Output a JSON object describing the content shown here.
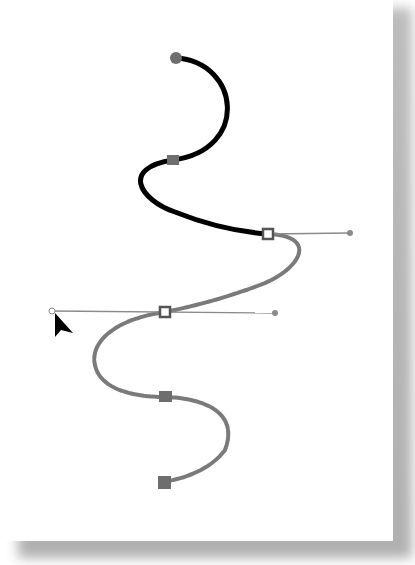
{
  "figure": {
    "colors": {
      "page": "#ffffff",
      "shadow": "#a8a8a8",
      "selected_segment": "#000000",
      "unselected_segment": "#7a7a7a",
      "handle_line": "#8a8a8a",
      "anchor_fill": "#6e6e6e",
      "selected_anchor_fill": "#ffffff",
      "cursor": "#000000"
    },
    "anchors": [
      {
        "id": "start",
        "x": 176,
        "y": 58,
        "shape": "round",
        "selected": false
      },
      {
        "id": "a2",
        "x": 173,
        "y": 160,
        "shape": "square",
        "selected": false
      },
      {
        "id": "a3",
        "x": 268,
        "y": 234,
        "shape": "square",
        "selected": true
      },
      {
        "id": "a4",
        "x": 165,
        "y": 312,
        "shape": "square",
        "selected": true
      },
      {
        "id": "a5",
        "x": 165,
        "y": 397,
        "shape": "square",
        "selected": false
      },
      {
        "id": "end",
        "x": 164,
        "y": 482,
        "shape": "square",
        "selected": false
      }
    ],
    "handles": [
      {
        "from": [
          268,
          234
        ],
        "to": [
          350,
          233
        ]
      },
      {
        "from": [
          52,
          311
        ],
        "to": [
          275,
          313
        ]
      }
    ],
    "cursor": {
      "type": "arrow",
      "x": 55,
      "y": 315
    }
  }
}
